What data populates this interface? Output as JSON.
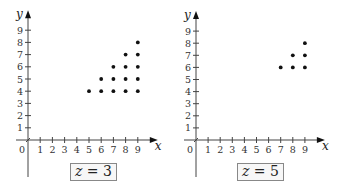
{
  "chart_data": [
    {
      "type": "scatter",
      "title": "",
      "caption": "z = 3",
      "xlabel": "x",
      "ylabel": "y",
      "xlim": [
        0,
        9
      ],
      "ylim": [
        0,
        9
      ],
      "xticks": [
        1,
        2,
        3,
        4,
        5,
        6,
        7,
        8,
        9
      ],
      "yticks": [
        1,
        2,
        3,
        4,
        5,
        6,
        7,
        8,
        9
      ],
      "origin_label": "0",
      "grid": false,
      "points": [
        [
          5,
          4
        ],
        [
          6,
          4
        ],
        [
          6,
          5
        ],
        [
          7,
          4
        ],
        [
          7,
          5
        ],
        [
          7,
          6
        ],
        [
          8,
          4
        ],
        [
          8,
          5
        ],
        [
          8,
          6
        ],
        [
          8,
          7
        ],
        [
          9,
          4
        ],
        [
          9,
          5
        ],
        [
          9,
          6
        ],
        [
          9,
          7
        ],
        [
          9,
          8
        ]
      ]
    },
    {
      "type": "scatter",
      "title": "",
      "caption": "z = 5",
      "xlabel": "x",
      "ylabel": "y",
      "xlim": [
        0,
        9
      ],
      "ylim": [
        0,
        9
      ],
      "xticks": [
        1,
        2,
        3,
        4,
        5,
        6,
        7,
        8,
        9
      ],
      "yticks": [
        1,
        2,
        3,
        4,
        5,
        6,
        7,
        8,
        9
      ],
      "origin_label": "0",
      "grid": false,
      "points": [
        [
          7,
          6
        ],
        [
          8,
          6
        ],
        [
          8,
          7
        ],
        [
          9,
          6
        ],
        [
          9,
          7
        ],
        [
          9,
          8
        ]
      ]
    }
  ],
  "panels": [
    {
      "caption_var": "z",
      "caption_eq": " = ",
      "caption_val": "3"
    },
    {
      "caption_var": "z",
      "caption_eq": " = ",
      "caption_val": "5"
    }
  ]
}
